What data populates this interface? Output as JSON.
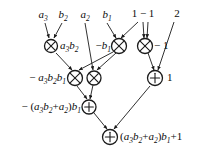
{
  "figure": {
    "type": "dataflow-graph",
    "colors": {
      "line": "#1a1a1a",
      "text": "#0b0b0b",
      "background": "#ffffff"
    }
  },
  "inputs": [
    {
      "id": "in-a3",
      "label": "a",
      "sub": "3",
      "x": 43,
      "y": 16
    },
    {
      "id": "in-b2",
      "label": "b",
      "sub": "2",
      "x": 63,
      "y": 16
    },
    {
      "id": "in-a2",
      "label": "a",
      "sub": "2",
      "x": 85,
      "y": 16
    },
    {
      "id": "in-b1",
      "label": "b",
      "sub": "1",
      "x": 107,
      "y": 16
    },
    {
      "id": "in-one-minus-one",
      "label": "1 − 1",
      "sub": "",
      "x": 143,
      "y": 15
    },
    {
      "id": "in-two",
      "label": "2",
      "sub": "",
      "x": 177,
      "y": 15
    }
  ],
  "nodes": [
    {
      "id": "mul-1",
      "kind": "multiply",
      "glyph": "⊗",
      "x": 51,
      "y": 46,
      "r": 6.5
    },
    {
      "id": "mul-2",
      "kind": "multiply",
      "glyph": "⊗",
      "x": 119,
      "y": 46,
      "r": 7.5
    },
    {
      "id": "mul-3",
      "kind": "multiply",
      "glyph": "⊗",
      "x": 145,
      "y": 46,
      "r": 7.5
    },
    {
      "id": "mul-4",
      "kind": "multiply",
      "glyph": "⊗",
      "x": 75,
      "y": 78,
      "r": 7.5
    },
    {
      "id": "mul-5",
      "kind": "multiply",
      "glyph": "⊗",
      "x": 94,
      "y": 78,
      "r": 7.0
    },
    {
      "id": "add-1",
      "kind": "add",
      "glyph": "⊕",
      "x": 155,
      "y": 78,
      "r": 7.5
    },
    {
      "id": "add-2",
      "kind": "add",
      "glyph": "⊕",
      "x": 89,
      "y": 107,
      "r": 7.0
    },
    {
      "id": "add-3",
      "kind": "add",
      "glyph": "⊕",
      "x": 110,
      "y": 137,
      "r": 7.5
    }
  ],
  "node_labels": [
    {
      "id": "lbl-a3b2",
      "text": "a3b2",
      "for": "mul-1",
      "align": "left",
      "x": 60,
      "y": 46
    },
    {
      "id": "lbl-minus-b1",
      "text": "−b1",
      "for": "mul-2",
      "align": "right",
      "x": 111,
      "y": 46
    },
    {
      "id": "lbl-minus-1",
      "text": "− 1",
      "for": "mul-3",
      "align": "left",
      "x": 154,
      "y": 46
    },
    {
      "id": "lbl-minus-a3b2b1",
      "text": "− a3b2b1",
      "for": "mul-4",
      "align": "right",
      "x": 66,
      "y": 78
    },
    {
      "id": "lbl-one",
      "text": "1",
      "for": "add-1",
      "align": "left",
      "x": 167,
      "y": 78
    },
    {
      "id": "lbl-partial-sum",
      "text": "− (a3b2+a2)b1",
      "for": "add-2",
      "align": "right",
      "x": 81,
      "y": 107
    },
    {
      "id": "lbl-result",
      "text": "(a3b2+a2)b1+1",
      "for": "add-3",
      "align": "left",
      "x": 120,
      "y": 137
    }
  ],
  "label_parts": {
    "a3b2": [
      {
        "t": "a",
        "sub": "3"
      },
      {
        "t": "b",
        "sub": "2"
      }
    ],
    "minus_b1": [
      {
        "t": "−",
        "op": true
      },
      {
        "t": "b",
        "sub": "1"
      }
    ],
    "minus_one": [
      {
        "t": "− 1",
        "op": true
      }
    ],
    "minus_a3b2b1": [
      {
        "t": "− ",
        "op": true
      },
      {
        "t": "a",
        "sub": "3"
      },
      {
        "t": "b",
        "sub": "2"
      },
      {
        "t": "b",
        "sub": "1"
      }
    ],
    "one": [
      {
        "t": "1",
        "op": true
      }
    ],
    "partial_sum": [
      {
        "t": "− (",
        "op": true
      },
      {
        "t": "a",
        "sub": "3"
      },
      {
        "t": "b",
        "sub": "2"
      },
      {
        "t": "+",
        "op": true
      },
      {
        "t": "a",
        "sub": "2"
      },
      {
        "t": ")",
        "op": true
      },
      {
        "t": "b",
        "sub": "1"
      }
    ],
    "result": [
      {
        "t": "(",
        "op": true
      },
      {
        "t": "a",
        "sub": "3"
      },
      {
        "t": "b",
        "sub": "2"
      },
      {
        "t": "+",
        "op": true
      },
      {
        "t": "a",
        "sub": "2"
      },
      {
        "t": ")",
        "op": true
      },
      {
        "t": "b",
        "sub": "1"
      },
      {
        "t": "+1",
        "op": true
      }
    ]
  },
  "edges": [
    {
      "id": "edge-a3-mul1",
      "from": "in-a3",
      "to": "mul-1",
      "x1": 45,
      "y1": 23,
      "x2": 49,
      "y2": 38
    },
    {
      "id": "edge-b2-mul1",
      "from": "in-b2",
      "to": "mul-1",
      "x1": 62,
      "y1": 23,
      "x2": 54,
      "y2": 38
    },
    {
      "id": "edge-a2-mul5",
      "from": "in-a2",
      "to": "mul-5",
      "x1": 85,
      "y1": 23,
      "x2": 93,
      "y2": 70
    },
    {
      "id": "edge-b1-mul2",
      "from": "in-b1",
      "to": "mul-2",
      "x1": 107,
      "y1": 23,
      "x2": 116,
      "y2": 38
    },
    {
      "id": "edge-omo-mul2",
      "from": "in-one-minus-one",
      "to": "mul-2",
      "x1": 138,
      "y1": 22,
      "x2": 121,
      "y2": 38
    },
    {
      "id": "edge-omo-mul3a",
      "from": "in-one-minus-one",
      "to": "mul-3",
      "x1": 143,
      "y1": 22,
      "x2": 144,
      "y2": 38
    },
    {
      "id": "edge-omo-mul3b",
      "from": "in-one-minus-one",
      "to": "mul-3",
      "x1": 148,
      "y1": 22,
      "x2": 147,
      "y2": 38
    },
    {
      "id": "edge-two-add1",
      "from": "in-two",
      "to": "add-1",
      "x1": 174,
      "y1": 22,
      "x2": 158,
      "y2": 70
    },
    {
      "id": "edge-mul1-mul4",
      "from": "mul-1",
      "to": "mul-4",
      "x1": 56,
      "y1": 53,
      "x2": 72,
      "y2": 70
    },
    {
      "id": "edge-mul2-mul4",
      "from": "mul-2",
      "to": "mul-4",
      "x1": 113,
      "y1": 52,
      "x2": 79,
      "y2": 70
    },
    {
      "id": "edge-mul2-mul5",
      "from": "mul-2",
      "to": "mul-5",
      "x1": 116,
      "y1": 53,
      "x2": 97,
      "y2": 70
    },
    {
      "id": "edge-mul3-add1",
      "from": "mul-3",
      "to": "add-1",
      "x1": 148,
      "y1": 53,
      "x2": 154,
      "y2": 70
    },
    {
      "id": "edge-mul4-add2",
      "from": "mul-4",
      "to": "add-2",
      "x1": 77,
      "y1": 86,
      "x2": 87,
      "y2": 99
    },
    {
      "id": "edge-mul5-add2",
      "from": "mul-5",
      "to": "add-2",
      "x1": 93,
      "y1": 85,
      "x2": 90,
      "y2": 99
    },
    {
      "id": "edge-add2-add3",
      "from": "add-2",
      "to": "add-3",
      "x1": 94,
      "y1": 113,
      "x2": 107,
      "y2": 129
    },
    {
      "id": "edge-add1-add3",
      "from": "add-1",
      "to": "add-3",
      "x1": 150,
      "y1": 86,
      "x2": 114,
      "y2": 129
    }
  ]
}
